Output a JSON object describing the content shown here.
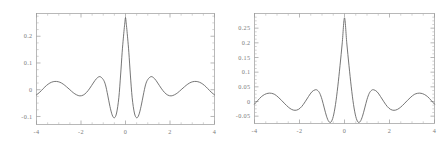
{
  "figure": {
    "background": "#ffffff",
    "curve_color": "#5d5d5d",
    "frame_color": "#9a9a9a",
    "label_color": "#7b7b7b"
  },
  "chart_data": [
    {
      "type": "line",
      "title": "",
      "subtitle": "",
      "xlabel": "",
      "ylabel": "",
      "xlim": [
        -4,
        4
      ],
      "ylim": [
        -0.13,
        0.285
      ],
      "grid": false,
      "legend": null,
      "panel": "left",
      "xticks": [
        -4,
        -2,
        0,
        2,
        4
      ],
      "xticklabels": [
        "-4",
        "-2",
        "0",
        "2",
        "4"
      ],
      "yticks": [
        -0.1,
        0,
        0.1,
        0.2
      ],
      "yticklabels": [
        "-0.1",
        "0",
        "0.1",
        "0.2"
      ],
      "annotations": [
        "narrow cusped central peak near x=0 reaching about 0.27",
        "decaying oscillatory side lobes, deepest minima about -0.105 near x=-0.75 and x=0.75"
      ],
      "series": [
        {
          "name": "left-curve",
          "points_x": [
            -4.0,
            -3.85,
            -3.7,
            -3.55,
            -3.4,
            -3.25,
            -3.1,
            -2.95,
            -2.8,
            -2.65,
            -2.5,
            -2.35,
            -2.2,
            -2.05,
            -1.9,
            -1.75,
            -1.6,
            -1.45,
            -1.3,
            -1.15,
            -1.0,
            -0.9,
            -0.8,
            -0.7,
            -0.6,
            -0.5,
            -0.4,
            -0.3,
            -0.22,
            -0.15,
            -0.1,
            -0.06,
            -0.03,
            0.0,
            0.03,
            0.06,
            0.1,
            0.15,
            0.22,
            0.3,
            0.4,
            0.5,
            0.6,
            0.7,
            0.8,
            0.9,
            1.0,
            1.15,
            1.3,
            1.45,
            1.6,
            1.75,
            1.9,
            2.05,
            2.2,
            2.35,
            2.5,
            2.65,
            2.8,
            2.95,
            3.1,
            3.25,
            3.4,
            3.55,
            3.7,
            3.85,
            4.0
          ],
          "points_y": [
            -0.019,
            -0.009,
            0.004,
            0.016,
            0.025,
            0.03,
            0.031,
            0.028,
            0.021,
            0.011,
            0.0,
            -0.011,
            -0.019,
            -0.023,
            -0.02,
            -0.01,
            0.006,
            0.025,
            0.042,
            0.049,
            0.038,
            0.018,
            -0.02,
            -0.062,
            -0.094,
            -0.105,
            -0.087,
            -0.03,
            0.055,
            0.14,
            0.19,
            0.226,
            0.25,
            0.27,
            0.25,
            0.226,
            0.19,
            0.14,
            0.055,
            -0.03,
            -0.087,
            -0.105,
            -0.094,
            -0.062,
            -0.02,
            0.018,
            0.038,
            0.049,
            0.042,
            0.025,
            0.006,
            -0.01,
            -0.02,
            -0.023,
            -0.019,
            -0.011,
            0.0,
            0.011,
            0.021,
            0.028,
            0.031,
            0.03,
            0.025,
            0.016,
            0.004,
            -0.009,
            -0.019
          ]
        }
      ]
    },
    {
      "type": "line",
      "title": "",
      "subtitle": "",
      "xlabel": "",
      "ylabel": "",
      "xlim": [
        -4,
        4
      ],
      "ylim": [
        -0.075,
        0.3
      ],
      "grid": false,
      "legend": null,
      "panel": "right",
      "xticks": [
        -4,
        -2,
        0,
        2,
        4
      ],
      "xticklabels": [
        "-4",
        "-2",
        "0",
        "2",
        "4"
      ],
      "yticks": [
        -0.05,
        0,
        0.05,
        0.1,
        0.15,
        0.2,
        0.25
      ],
      "yticklabels": [
        "-0.05",
        "0",
        "0.05",
        "0.1",
        "0.15",
        "0.2",
        "0.25"
      ],
      "annotations": [
        "smooth broad central peak at x=0 reaching about 0.285",
        "symmetric decaying side lobes, minima about -0.068 near x=-1.1 and x=1.1"
      ],
      "series": [
        {
          "name": "right-curve",
          "points_x": [
            -4.0,
            -3.85,
            -3.7,
            -3.55,
            -3.4,
            -3.25,
            -3.1,
            -2.95,
            -2.8,
            -2.65,
            -2.5,
            -2.35,
            -2.2,
            -2.05,
            -1.9,
            -1.75,
            -1.6,
            -1.45,
            -1.3,
            -1.2,
            -1.1,
            -1.0,
            -0.9,
            -0.8,
            -0.7,
            -0.6,
            -0.5,
            -0.4,
            -0.3,
            -0.2,
            -0.1,
            0.0,
            0.1,
            0.2,
            0.3,
            0.4,
            0.5,
            0.6,
            0.7,
            0.8,
            0.9,
            1.0,
            1.1,
            1.2,
            1.3,
            1.45,
            1.6,
            1.75,
            1.9,
            2.05,
            2.2,
            2.35,
            2.5,
            2.65,
            2.8,
            2.95,
            3.1,
            3.25,
            3.4,
            3.55,
            3.7,
            3.85,
            4.0
          ],
          "points_y": [
            -0.009,
            0.004,
            0.016,
            0.024,
            0.028,
            0.028,
            0.024,
            0.015,
            0.004,
            -0.008,
            -0.019,
            -0.027,
            -0.03,
            -0.027,
            -0.017,
            -0.001,
            0.017,
            0.033,
            0.04,
            0.038,
            0.028,
            0.007,
            -0.022,
            -0.05,
            -0.068,
            -0.07,
            -0.051,
            -0.01,
            0.05,
            0.122,
            0.2,
            0.285,
            0.2,
            0.122,
            0.05,
            -0.01,
            -0.051,
            -0.07,
            -0.068,
            -0.05,
            -0.022,
            0.007,
            0.028,
            0.038,
            0.04,
            0.033,
            0.017,
            -0.001,
            -0.017,
            -0.027,
            -0.03,
            -0.027,
            -0.019,
            -0.008,
            0.004,
            0.015,
            0.024,
            0.028,
            0.028,
            0.024,
            0.016,
            0.004,
            -0.009
          ]
        }
      ]
    }
  ]
}
